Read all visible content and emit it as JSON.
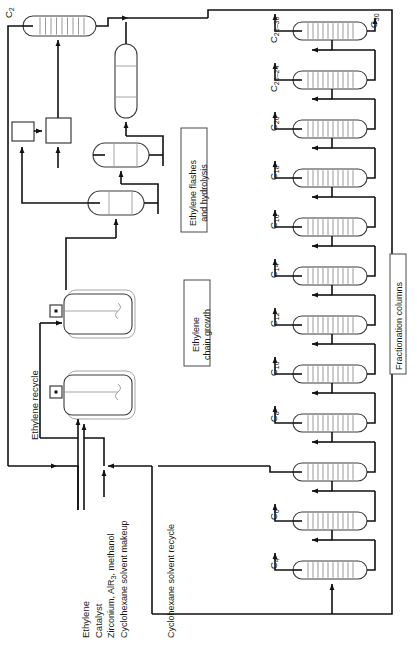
{
  "diagram": {
    "orientation": "rotated-90-ccw",
    "colors": {
      "line": "#111111",
      "vessel_outline": "#3b3b3b",
      "vessel_inner": "#9a9a9a",
      "tray": "#8d8d8d",
      "background": "#ffffff"
    }
  },
  "section_labels": [
    {
      "id": "flashes",
      "line1": "Ethylene flashes",
      "line2": "and hydrolysis"
    },
    {
      "id": "chain-growth",
      "line1": "Ethylene",
      "line2": "chain growth"
    },
    {
      "id": "fractionation",
      "line1": "Fractionation columns",
      "line2": ""
    }
  ],
  "feed_streams": [
    {
      "id": "ethylene",
      "label": "Ethylene"
    },
    {
      "id": "catalyst",
      "label": "Catalyst"
    },
    {
      "id": "catalyst-detail",
      "label": "Zirconium, AlR3, methanol",
      "label_html": "Zirconium, AlR<sub>3</sub>, methanol"
    },
    {
      "id": "cyclohexane-makeup",
      "label": "Cyclohexane solvent makeup"
    }
  ],
  "recycle_streams": [
    {
      "id": "ethylene-recycle",
      "label": "Ethylene recycle"
    },
    {
      "id": "cyclohexane-recycle",
      "label": "Cyclohexane solvent recycle"
    }
  ],
  "product_streams": [
    {
      "id": "c2",
      "label": "C2",
      "label_html": "C<sub>2</sub>"
    },
    {
      "id": "c30",
      "label": "C30",
      "label_html": "C<sub>30</sub>"
    }
  ],
  "columns": [
    {
      "id": "col-c26-30",
      "label": "C26-30",
      "label_html": "C<sub>26&#8211;30</sub>"
    },
    {
      "id": "col-c20-24",
      "label": "C20-24",
      "label_html": "C<sub>20&#8211;24</sub>"
    },
    {
      "id": "col-c20",
      "label": "C20",
      "label_html": "C<sub>20</sub>"
    },
    {
      "id": "col-c18",
      "label": "C18",
      "label_html": "C<sub>18</sub>"
    },
    {
      "id": "col-c16",
      "label": "C16",
      "label_html": "C<sub>16</sub>"
    },
    {
      "id": "col-c14",
      "label": "C14",
      "label_html": "C<sub>14</sub>"
    },
    {
      "id": "col-c12",
      "label": "C12",
      "label_html": "C<sub>12</sub>"
    },
    {
      "id": "col-c10",
      "label": "C10",
      "label_html": "C<sub>10</sub>"
    },
    {
      "id": "col-c8",
      "label": "C8",
      "label_html": "C<sub>8</sub>"
    },
    {
      "id": "col-solvent",
      "label": "",
      "label_html": ""
    },
    {
      "id": "col-c6",
      "label": "C6",
      "label_html": "C<sub>6</sub>"
    },
    {
      "id": "col-c4",
      "label": "C4",
      "label_html": "C<sub>4</sub>"
    }
  ],
  "equipment": {
    "reactors": [
      {
        "id": "reactor-1",
        "type": "stirred-jacketed-vessel"
      },
      {
        "id": "reactor-2",
        "type": "stirred-jacketed-vessel"
      }
    ],
    "flash_drums": [
      {
        "id": "flash-drum-1",
        "type": "horizontal-drum"
      },
      {
        "id": "flash-drum-2",
        "type": "horizontal-drum"
      }
    ],
    "hydrolysis_vessel": {
      "id": "hydrolysis-vessel",
      "type": "vertical-vessel"
    },
    "separator_boxes": [
      {
        "id": "sep-box-small",
        "type": "rect-unit"
      },
      {
        "id": "sep-box-large",
        "type": "rect-unit"
      }
    ],
    "top_column": {
      "id": "ethylene-recovery-column",
      "type": "trayed-column"
    }
  }
}
